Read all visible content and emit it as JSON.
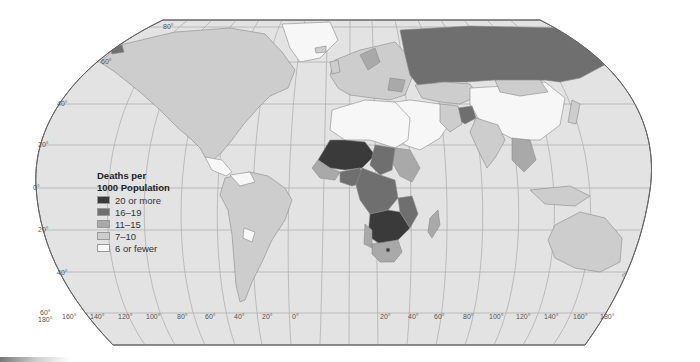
{
  "map": {
    "title": "Deaths per 1000 Population",
    "projection": "Robinson",
    "colors": {
      "ocean": "#e3e3e3",
      "graticule": "#b0b0b0",
      "border": "#8a8a8a",
      "outline": "#666666"
    },
    "latitude_labels": [
      {
        "text": "80°",
        "x": 163,
        "y": 23
      },
      {
        "text": "60°",
        "x": 101,
        "y": 58
      },
      {
        "text": "40°",
        "x": 57,
        "y": 100
      },
      {
        "text": "20°",
        "x": 38,
        "y": 141
      },
      {
        "text": "0°",
        "x": 33,
        "y": 184
      },
      {
        "text": "20°",
        "x": 38,
        "y": 226
      },
      {
        "text": "40°",
        "x": 57,
        "y": 269
      },
      {
        "text": "60°",
        "x": 40,
        "y": 309
      }
    ],
    "longitude_labels": [
      {
        "text": "180°",
        "x": 38,
        "y": 316
      },
      {
        "text": "160°",
        "x": 62,
        "y": 313
      },
      {
        "text": "140°",
        "x": 90,
        "y": 313
      },
      {
        "text": "120°",
        "x": 118,
        "y": 313
      },
      {
        "text": "100°",
        "x": 146,
        "y": 313
      },
      {
        "text": "80°",
        "x": 177,
        "y": 313
      },
      {
        "text": "60°",
        "x": 205,
        "y": 313
      },
      {
        "text": "40°",
        "x": 234,
        "y": 313
      },
      {
        "text": "20°",
        "x": 262,
        "y": 313
      },
      {
        "text": "0°",
        "x": 292,
        "y": 313
      },
      {
        "text": "20°",
        "x": 380,
        "y": 313
      },
      {
        "text": "40°",
        "x": 408,
        "y": 313
      },
      {
        "text": "60°",
        "x": 434,
        "y": 313
      },
      {
        "text": "80°",
        "x": 463,
        "y": 313
      },
      {
        "text": "100°",
        "x": 489,
        "y": 313
      },
      {
        "text": "120°",
        "x": 516,
        "y": 313
      },
      {
        "text": "140°",
        "x": 544,
        "y": 313
      },
      {
        "text": "160°",
        "x": 573,
        "y": 313
      },
      {
        "text": "180°",
        "x": 600,
        "y": 313
      }
    ]
  },
  "legend": {
    "title_line1": "Deaths per",
    "title_line2": "1000 Population",
    "items": [
      {
        "label": "20 or more",
        "color": "#3a3a3a"
      },
      {
        "label": "16–19",
        "color": "#6f6f6f"
      },
      {
        "label": "11–15",
        "color": "#a9a9a9"
      },
      {
        "label": "7–10",
        "color": "#cdcdcd"
      },
      {
        "label": "6 or fewer",
        "color": "#f7f7f7"
      }
    ]
  },
  "regions": [
    {
      "name": "Russia",
      "category": "16–19"
    },
    {
      "name": "Afghanistan",
      "category": "16–19"
    },
    {
      "name": "Central/Southern Africa",
      "category": "20 or more"
    },
    {
      "name": "West Africa (Sahel)",
      "category": "20 or more"
    },
    {
      "name": "China",
      "category": "6 or fewer"
    },
    {
      "name": "North Africa / Middle East",
      "category": "6 or fewer"
    },
    {
      "name": "Greenland",
      "category": "6 or fewer"
    },
    {
      "name": "North America",
      "category": "7–10"
    },
    {
      "name": "South America",
      "category": "7–10"
    },
    {
      "name": "Australia",
      "category": "7–10"
    },
    {
      "name": "Europe",
      "category": "11–15"
    },
    {
      "name": "India",
      "category": "7–10"
    }
  ]
}
